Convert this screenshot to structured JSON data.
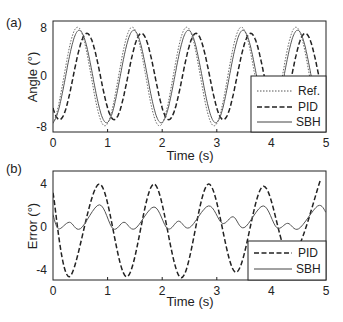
{
  "chart_data": [
    {
      "panel_label": "(a)",
      "type": "line",
      "title": "",
      "xlabel": "Time (s)",
      "ylabel": "Angle (°)",
      "xlim": [
        0,
        5
      ],
      "ylim": [
        -9,
        9
      ],
      "xticks": [
        "0",
        "1",
        "2",
        "3",
        "4",
        "5"
      ],
      "yticks": [
        "-8",
        "0",
        "8"
      ],
      "grid": false,
      "legend_position": "lower right",
      "series": [
        {
          "name": "Ref.",
          "style": "dotted",
          "amplitude": 8,
          "period": 1.0,
          "peak_time": 0.45,
          "description": "sinusoid ±8°, period ~1 s"
        },
        {
          "name": "PID",
          "style": "dashed",
          "amplitude": 7,
          "period": 1.0,
          "peak_time": 0.62,
          "description": "lagging sinusoid ~±7°, peaks ~0.17 s after Ref."
        },
        {
          "name": "SBH",
          "style": "solid",
          "amplitude": 7.5,
          "period": 1.0,
          "peak_time": 0.48,
          "description": "close tracking of Ref., slightly lower amplitude"
        }
      ]
    },
    {
      "panel_label": "(b)",
      "type": "line",
      "title": "",
      "xlabel": "Time (s)",
      "ylabel": "Error (°)",
      "xlim": [
        0,
        5
      ],
      "ylim": [
        -5,
        5
      ],
      "xticks": [
        "0",
        "1",
        "2",
        "3",
        "4",
        "5"
      ],
      "yticks": [
        "-4",
        "0",
        "4"
      ],
      "grid": false,
      "legend_position": "lower right",
      "series": [
        {
          "name": "PID",
          "style": "dashed",
          "x": [
            0,
            0.3,
            0.85,
            1.35,
            1.85,
            2.35,
            2.85,
            3.35,
            3.85,
            4.35,
            4.9
          ],
          "values": [
            3,
            -4.7,
            3.8,
            -4.7,
            3.8,
            -4.8,
            3.8,
            -4.3,
            3.6,
            -3.0,
            4.2
          ]
        },
        {
          "name": "SBH",
          "style": "solid",
          "x": [
            0,
            0.1,
            0.3,
            0.5,
            0.85,
            1.1,
            1.3,
            1.5,
            1.85,
            2.1,
            2.3,
            2.5,
            2.85,
            3.1,
            3.3,
            3.5,
            3.85,
            4.1,
            4.3,
            4.5,
            4.85,
            5.0
          ],
          "values": [
            1,
            -0.3,
            0.3,
            -0.3,
            1.9,
            -0.3,
            0.3,
            -0.3,
            1.7,
            -0.3,
            0.4,
            -0.2,
            1.8,
            0.2,
            0.8,
            -0.2,
            1.8,
            -0.2,
            0.2,
            -0.3,
            1.8,
            1.2
          ]
        }
      ]
    }
  ]
}
